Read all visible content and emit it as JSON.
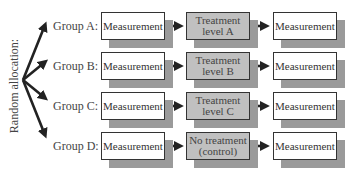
{
  "diagram": {
    "side_label": "Random allocation:",
    "groups": [
      {
        "label": "Group A:",
        "pre": "Measurement",
        "treatment_line1": "Treatment",
        "treatment_line2": "level A",
        "post": "Measurement"
      },
      {
        "label": "Group B:",
        "pre": "Measurement",
        "treatment_line1": "Treatment",
        "treatment_line2": "level B",
        "post": "Measurement"
      },
      {
        "label": "Group C:",
        "pre": "Measurement",
        "treatment_line1": "Treatment",
        "treatment_line2": "level C",
        "post": "Measurement"
      },
      {
        "label": "Group D:",
        "pre": "Measurement",
        "treatment_line1": "No treatment",
        "treatment_line2": "(control)",
        "post": "Measurement"
      }
    ],
    "colors": {
      "box_fill": "#ffffff",
      "treatment_fill": "#c0c0c0",
      "shadow": "#9a9a9a",
      "arrow": "#222222"
    }
  }
}
